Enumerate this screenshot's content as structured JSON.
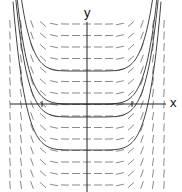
{
  "diagram": {
    "type": "slope_field",
    "axes": {
      "x_label": "x",
      "y_label": "y",
      "origin_px": [
        87,
        104
      ],
      "x_axis_px": [
        10,
        166
      ],
      "y_axis_px": [
        22,
        192
      ],
      "x_ticks_px": [
        42,
        132
      ],
      "color": "#222222"
    },
    "field": {
      "columns_px": [
        10,
        21,
        32,
        43,
        54,
        65,
        76,
        87,
        98,
        109,
        120,
        131,
        142,
        153,
        164
      ],
      "rows_px": [
        24,
        35.5,
        47,
        58.5,
        70,
        81.5,
        93,
        104.5,
        116,
        127.5,
        139,
        150.5,
        162,
        173.5,
        185
      ],
      "segment_length_px": 8,
      "color": "#8a8a8a"
    },
    "solution_curves": {
      "flat_levels_px": [
        71,
        104,
        117,
        150
      ],
      "color": "#444444"
    }
  }
}
